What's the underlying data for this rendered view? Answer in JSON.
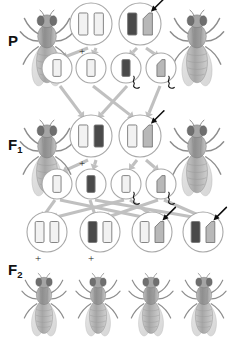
{
  "figure": {
    "title_visible": false,
    "background_color": "#ffffff",
    "arrow_color": "#c0c0c0",
    "circle_outline_color": "#a8a8a8",
    "allele_light_color": "#f2f2f2",
    "allele_dark_color": "#4a4a4a",
    "allele_mid_color": "#b8b8b8",
    "fly_body_color": "#9a9a9a",
    "fly_wing_color": "#d8d8d8"
  },
  "generations": [
    {
      "id": "P",
      "label": "P",
      "subscript": ""
    },
    {
      "id": "F1",
      "label": "F",
      "subscript": "1"
    },
    {
      "id": "F2",
      "label": "F",
      "subscript": "2"
    }
  ],
  "labels": {
    "p_label": "P",
    "f1_label": "F",
    "f1_subscript": "1",
    "f2_label": "F",
    "f2_subscript": "2",
    "wild_type_symbol": "+"
  },
  "rows": {
    "P": {
      "label": "P",
      "flies": [
        {
          "name": "p-fly-left",
          "phenotype": "wild-type",
          "x": 18,
          "y": 8
        },
        {
          "name": "p-fly-right",
          "phenotype": "mutant",
          "x": 168,
          "y": 8
        }
      ],
      "genotype_circles": [
        {
          "name": "p-genotype-left",
          "x": 91,
          "y": 24,
          "r": 21,
          "left_allele": {
            "type": "bar",
            "shade": "light"
          },
          "right_allele": {
            "type": "bar",
            "shade": "light"
          },
          "wild_type_plus": true,
          "arrow_pointer": false
        },
        {
          "name": "p-genotype-right",
          "x": 140,
          "y": 24,
          "r": 21,
          "left_allele": {
            "type": "bar",
            "shade": "dark"
          },
          "right_allele": {
            "type": "notched",
            "shade": "mid"
          },
          "wild_type_plus": false,
          "arrow_pointer": true
        }
      ],
      "gametes": [
        {
          "name": "p-gamete-1",
          "x": 57,
          "y": 68,
          "r": 15,
          "allele": {
            "type": "bar",
            "shade": "light"
          },
          "squiggle": false
        },
        {
          "name": "p-gamete-2",
          "x": 91,
          "y": 68,
          "r": 15,
          "allele": {
            "type": "bar",
            "shade": "light"
          },
          "squiggle": false
        },
        {
          "name": "p-gamete-3",
          "x": 126,
          "y": 68,
          "r": 15,
          "allele": {
            "type": "bar",
            "shade": "dark"
          },
          "squiggle": true
        },
        {
          "name": "p-gamete-4",
          "x": 161,
          "y": 68,
          "r": 15,
          "allele": {
            "type": "notched",
            "shade": "mid"
          },
          "squiggle": true
        }
      ]
    },
    "F1": {
      "label": "F1",
      "flies": [
        {
          "name": "f1-fly-left",
          "phenotype": "wild-type",
          "x": 18,
          "y": 118
        },
        {
          "name": "f1-fly-right",
          "phenotype": "wild-type",
          "x": 168,
          "y": 118
        }
      ],
      "genotype_circles": [
        {
          "name": "f1-genotype-left",
          "x": 91,
          "y": 136,
          "r": 21,
          "left_allele": {
            "type": "bar",
            "shade": "light"
          },
          "right_allele": {
            "type": "bar",
            "shade": "dark"
          },
          "wild_type_plus": true,
          "arrow_pointer": false
        },
        {
          "name": "f1-genotype-right",
          "x": 140,
          "y": 136,
          "r": 21,
          "left_allele": {
            "type": "bar",
            "shade": "light"
          },
          "right_allele": {
            "type": "notched",
            "shade": "mid"
          },
          "wild_type_plus": false,
          "arrow_pointer": true
        }
      ],
      "gametes": [
        {
          "name": "f1-gamete-1",
          "x": 57,
          "y": 184,
          "r": 15,
          "allele": {
            "type": "bar",
            "shade": "light"
          },
          "squiggle": false
        },
        {
          "name": "f1-gamete-2",
          "x": 91,
          "y": 184,
          "r": 15,
          "allele": {
            "type": "bar",
            "shade": "dark"
          },
          "squiggle": false
        },
        {
          "name": "f1-gamete-3",
          "x": 126,
          "y": 184,
          "r": 15,
          "allele": {
            "type": "bar",
            "shade": "light"
          },
          "squiggle": true
        },
        {
          "name": "f1-gamete-4",
          "x": 161,
          "y": 184,
          "r": 15,
          "allele": {
            "type": "notched",
            "shade": "mid"
          },
          "squiggle": true
        }
      ]
    },
    "F2": {
      "label": "F2",
      "genotype_circles": [
        {
          "name": "f2-genotype-1",
          "x": 47,
          "y": 232,
          "r": 20,
          "left_allele": {
            "type": "bar",
            "shade": "light"
          },
          "right_allele": {
            "type": "bar",
            "shade": "light"
          },
          "wild_type_plus": true,
          "arrow_pointer": false
        },
        {
          "name": "f2-genotype-2",
          "x": 100,
          "y": 232,
          "r": 20,
          "left_allele": {
            "type": "bar",
            "shade": "dark"
          },
          "right_allele": {
            "type": "bar",
            "shade": "light"
          },
          "wild_type_plus": true,
          "arrow_pointer": false
        },
        {
          "name": "f2-genotype-3",
          "x": 152,
          "y": 232,
          "r": 20,
          "left_allele": {
            "type": "bar",
            "shade": "light"
          },
          "right_allele": {
            "type": "notched",
            "shade": "mid"
          },
          "wild_type_plus": false,
          "arrow_pointer": true
        },
        {
          "name": "f2-genotype-4",
          "x": 203,
          "y": 232,
          "r": 20,
          "left_allele": {
            "type": "bar",
            "shade": "dark"
          },
          "right_allele": {
            "type": "notched",
            "shade": "mid"
          },
          "wild_type_plus": false,
          "arrow_pointer": true
        }
      ],
      "flies": [
        {
          "name": "f2-fly-1",
          "phenotype": "wild-type",
          "x": 20,
          "y": 272
        },
        {
          "name": "f2-fly-2",
          "phenotype": "wild-type",
          "x": 74,
          "y": 272
        },
        {
          "name": "f2-fly-3",
          "phenotype": "mutant",
          "x": 127,
          "y": 272
        },
        {
          "name": "f2-fly-4",
          "phenotype": "mutant",
          "x": 180,
          "y": 272
        }
      ]
    }
  },
  "arrows": {
    "p_to_gametes": [
      {
        "from": [
          88,
          48
        ],
        "to": [
          62,
          58
        ]
      },
      {
        "from": [
          96,
          48
        ],
        "to": [
          93,
          56
        ]
      },
      {
        "from": [
          137,
          48
        ],
        "to": [
          129,
          56
        ]
      },
      {
        "from": [
          146,
          48
        ],
        "to": [
          159,
          57
        ]
      }
    ],
    "p_gametes_to_f1": [
      {
        "from": [
          60,
          86
        ],
        "to": [
          84,
          118
        ]
      },
      {
        "from": [
          93,
          86
        ],
        "to": [
          134,
          118
        ]
      },
      {
        "from": [
          127,
          86
        ],
        "to": [
          98,
          118
        ]
      },
      {
        "from": [
          160,
          86
        ],
        "to": [
          147,
          118
        ]
      }
    ],
    "f1_to_gametes": [
      {
        "from": [
          88,
          160
        ],
        "to": [
          62,
          172
        ]
      },
      {
        "from": [
          96,
          160
        ],
        "to": [
          93,
          170
        ]
      },
      {
        "from": [
          137,
          160
        ],
        "to": [
          129,
          170
        ]
      },
      {
        "from": [
          146,
          160
        ],
        "to": [
          159,
          171
        ]
      }
    ],
    "f1_gametes_to_f2": [
      {
        "from": [
          55,
          200
        ],
        "to": [
          42,
          218
        ]
      },
      {
        "from": [
          60,
          200
        ],
        "to": [
          148,
          218
        ]
      },
      {
        "from": [
          90,
          200
        ],
        "to": [
          96,
          218
        ]
      },
      {
        "from": [
          95,
          200
        ],
        "to": [
          198,
          218
        ]
      },
      {
        "from": [
          124,
          200
        ],
        "to": [
          52,
          218
        ]
      },
      {
        "from": [
          130,
          200
        ],
        "to": [
          156,
          218
        ]
      },
      {
        "from": [
          158,
          200
        ],
        "to": [
          105,
          218
        ]
      },
      {
        "from": [
          164,
          200
        ],
        "to": [
          205,
          218
        ]
      }
    ]
  }
}
